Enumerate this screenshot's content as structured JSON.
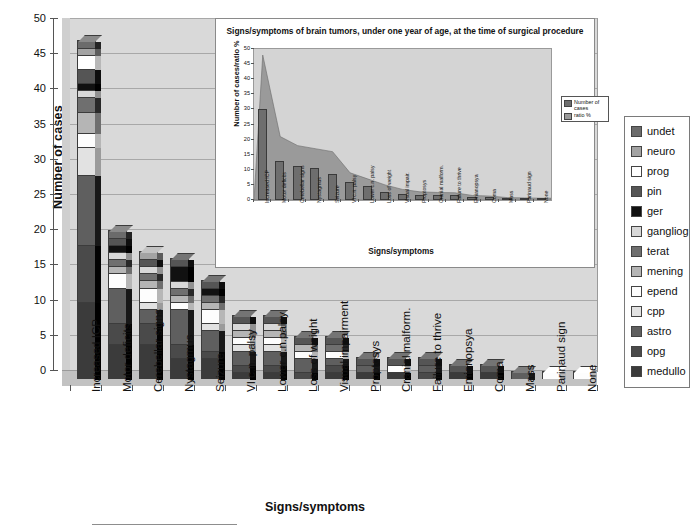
{
  "main": {
    "y_axis_title": "Number of cases",
    "x_axis_title": "Signs/symptoms"
  },
  "legend": {
    "items": [
      {
        "label": "undet",
        "color": "#6b6b6b"
      },
      {
        "label": "neuro",
        "color": "#a3a3a3"
      },
      {
        "label": "prog",
        "color": "#ffffff"
      },
      {
        "label": "pin",
        "color": "#555555"
      },
      {
        "label": "ger",
        "color": "#111111"
      },
      {
        "label": "gangliog",
        "color": "#d8d8d8"
      },
      {
        "label": "terat",
        "color": "#6f6f6f"
      },
      {
        "label": "mening",
        "color": "#b5b5b5"
      },
      {
        "label": "epend",
        "color": "#fdfdfd"
      },
      {
        "label": "cpp",
        "color": "#e2e2e2"
      },
      {
        "label": "astro",
        "color": "#5f5f5f"
      },
      {
        "label": "opg",
        "color": "#4a4a4a"
      },
      {
        "label": "medullo",
        "color": "#3b3b3b"
      }
    ]
  },
  "inset": {
    "title": "Signs/symptoms of brain tumors, under one year of age, at the time of surgical procedure",
    "legend": [
      {
        "label": "Number of cases",
        "color": "#6e6e6e"
      },
      {
        "label": "ratio %",
        "color": "#9a9a9a"
      }
    ]
  },
  "chart_data": [
    {
      "type": "bar",
      "title": "",
      "xlabel": "Signs/symptoms",
      "ylabel": "Number of cases",
      "ylim": [
        0,
        50
      ],
      "yticks": [
        0,
        5,
        10,
        15,
        20,
        25,
        30,
        35,
        40,
        45,
        50
      ],
      "grid": true,
      "stacked": true,
      "categories": [
        "Increased ICP",
        "Motor deficits",
        "Cerebellar signs",
        "Nystagmus",
        "Seizure",
        "VI c.n. palsy",
        "Lower c.n.palsy",
        "Loss of weight",
        "Visual impairment",
        "Proptosys",
        "Cranial malform.",
        "Failure to thrive",
        "Emianopsya",
        "Coma",
        "Mass",
        "Parinaud sign",
        "None"
      ],
      "totals": [
        48,
        21,
        18,
        17,
        14,
        9,
        9,
        6,
        6,
        3,
        3,
        3,
        2,
        2,
        1,
        1,
        1
      ],
      "series": [
        {
          "name": "medullo",
          "color": "#3b3b3b",
          "values": [
            11,
            5,
            5,
            3,
            3,
            1,
            1,
            0,
            1,
            1,
            1,
            0,
            1,
            1,
            0,
            0,
            0
          ]
        },
        {
          "name": "opg",
          "color": "#4a4a4a",
          "values": [
            8,
            3,
            3,
            2,
            1,
            1,
            1,
            1,
            1,
            0,
            0,
            1,
            0,
            0,
            0,
            0,
            0
          ]
        },
        {
          "name": "astro",
          "color": "#5f5f5f",
          "values": [
            10,
            5,
            2,
            5,
            3,
            2,
            2,
            2,
            1,
            1,
            0,
            1,
            0,
            0,
            1,
            0,
            0
          ]
        },
        {
          "name": "cpp",
          "color": "#e2e2e2",
          "values": [
            4,
            0,
            1,
            0,
            1,
            1,
            1,
            0,
            0,
            0,
            0,
            0,
            0,
            0,
            0,
            0,
            0
          ]
        },
        {
          "name": "epend",
          "color": "#fdfdfd",
          "values": [
            2,
            2,
            2,
            1,
            2,
            1,
            1,
            1,
            1,
            0,
            1,
            0,
            0,
            0,
            0,
            1,
            1
          ]
        },
        {
          "name": "mening",
          "color": "#b5b5b5",
          "values": [
            3,
            1,
            1,
            1,
            1,
            1,
            1,
            1,
            0,
            0,
            0,
            0,
            0,
            0,
            0,
            0,
            0
          ]
        },
        {
          "name": "terat",
          "color": "#6f6f6f",
          "values": [
            2,
            1,
            1,
            1,
            1,
            0,
            0,
            0,
            1,
            0,
            0,
            0,
            0,
            0,
            0,
            0,
            0
          ]
        },
        {
          "name": "ganglioq",
          "color": "#d8d8d8",
          "values": [
            1,
            1,
            1,
            1,
            0,
            1,
            1,
            0,
            0,
            0,
            0,
            0,
            0,
            0,
            0,
            0,
            0
          ]
        },
        {
          "name": "ger",
          "color": "#111111",
          "values": [
            1,
            1,
            0,
            2,
            1,
            0,
            0,
            0,
            0,
            0,
            0,
            0,
            0,
            0,
            0,
            0,
            0
          ]
        },
        {
          "name": "pin",
          "color": "#555555",
          "values": [
            2,
            1,
            1,
            1,
            1,
            1,
            1,
            1,
            1,
            1,
            1,
            1,
            1,
            1,
            0,
            0,
            0
          ]
        },
        {
          "name": "prog",
          "color": "#ffffff",
          "values": [
            2,
            0,
            0,
            0,
            0,
            0,
            0,
            0,
            0,
            0,
            0,
            0,
            0,
            0,
            0,
            0,
            0
          ]
        },
        {
          "name": "neuro",
          "color": "#a3a3a3",
          "values": [
            1,
            0,
            1,
            0,
            0,
            0,
            0,
            0,
            0,
            0,
            0,
            0,
            0,
            0,
            0,
            0,
            0
          ]
        },
        {
          "name": "undet",
          "color": "#6b6b6b",
          "values": [
            1,
            1,
            0,
            0,
            0,
            0,
            0,
            0,
            0,
            0,
            0,
            0,
            0,
            0,
            0,
            0,
            0
          ]
        }
      ]
    },
    {
      "type": "bar",
      "title": "Signs/symptoms of brain tumors, under one year of age, at the time of surgical procedure",
      "xlabel": "Signs/symptoms",
      "ylabel": "Number of cases/ratio %",
      "ylim": [
        0,
        50
      ],
      "yticks": [
        0,
        5,
        10,
        15,
        20,
        25,
        30,
        35,
        40,
        45,
        50
      ],
      "grid": false,
      "categories": [
        "Increased ICP",
        "Motor deficits",
        "Cerebellar signs",
        "Nystagmus",
        "Seizure",
        "VI c.n. palsy",
        "Lower c.n. palsy",
        "Loss of weight",
        "Visual impair.",
        "Proptosys",
        "Cranial malform.",
        "Failure to thrive",
        "Emianopsya",
        "Coma",
        "Mass",
        "Parinaud sign",
        "None"
      ],
      "series": [
        {
          "name": "Number of cases",
          "type": "bar",
          "color": "#6e6e6e",
          "values": [
            30,
            13,
            11.3,
            10.7,
            8.7,
            5.8,
            4.8,
            2.8,
            2.1,
            1.8,
            1.6,
            1.8,
            1,
            1,
            0.4,
            0.4,
            0.6
          ]
        },
        {
          "name": "ratio %",
          "type": "area",
          "color": "#9a9a9a",
          "values": [
            48,
            21,
            18,
            17,
            16,
            9,
            7,
            5,
            3.5,
            2.7,
            2.5,
            2.4,
            1.5,
            1.3,
            0.8,
            0.7,
            0.6
          ]
        }
      ]
    }
  ]
}
